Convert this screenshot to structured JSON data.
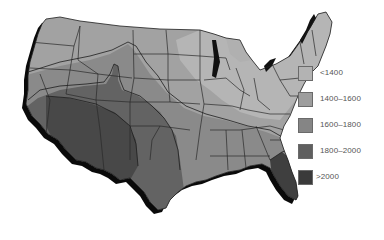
{
  "map": {
    "title": "",
    "region": "Contiguous United States",
    "zones": [
      {
        "label": "<1400",
        "color": "#b3b3b3"
      },
      {
        "label": "1400–1600",
        "color": "#9d9d9d"
      },
      {
        "label": "1600–1800",
        "color": "#858585"
      },
      {
        "label": "1800–2000",
        "color": "#5f5f5f"
      },
      {
        "label": ">2000",
        "color": "#3a3a3a"
      }
    ]
  },
  "legend": {
    "items": [
      {
        "label": "<1400",
        "color": "#b3b3b3"
      },
      {
        "label": "1400–1600",
        "color": "#9d9d9d"
      },
      {
        "label": "1600–1800",
        "color": "#858585"
      },
      {
        "label": "1800–2000",
        "color": "#5f5f5f"
      },
      {
        "label": ">2000",
        "color": "#3a3a3a"
      }
    ]
  }
}
